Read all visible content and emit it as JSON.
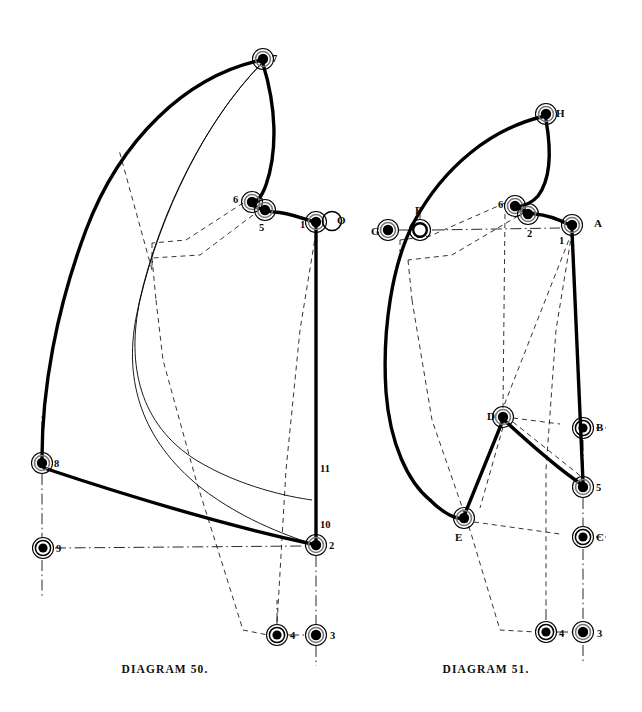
{
  "page": {
    "width": 642,
    "height": 712,
    "background": "#ffffff",
    "ink": "#000000",
    "kind": "engineering-linkage-plate"
  },
  "captions": {
    "left": "DIAGRAM 50.",
    "right": "DIAGRAM 51."
  },
  "diagram_left": {
    "name": "DIAGRAM 50.",
    "labels": [
      {
        "id": "7",
        "text": "7",
        "x": 272,
        "y": 53
      },
      {
        "id": "6",
        "text": "6",
        "x": 233,
        "y": 194
      },
      {
        "id": "5",
        "text": "5",
        "x": 259,
        "y": 222
      },
      {
        "id": "1",
        "text": "1",
        "x": 300,
        "y": 219
      },
      {
        "id": "O",
        "text": "O",
        "x": 337,
        "y": 215
      },
      {
        "id": "8",
        "text": "8",
        "x": 54,
        "y": 458
      },
      {
        "id": "9",
        "text": "9",
        "x": 56,
        "y": 543
      },
      {
        "id": "11",
        "text": "11",
        "x": 320,
        "y": 463
      },
      {
        "id": "10",
        "text": "10",
        "x": 320,
        "y": 519
      },
      {
        "id": "2",
        "text": "2",
        "x": 329,
        "y": 540
      },
      {
        "id": "4",
        "text": "4",
        "x": 290,
        "y": 630
      },
      {
        "id": "3",
        "text": "3",
        "x": 330,
        "y": 630
      }
    ],
    "joints": [
      {
        "id": "7",
        "x": 263,
        "y": 59,
        "style": "solid-dot-ring"
      },
      {
        "id": "6",
        "x": 252,
        "y": 202,
        "style": "solid-dot-ring"
      },
      {
        "id": "5",
        "x": 265,
        "y": 210,
        "style": "solid-dot-ring"
      },
      {
        "id": "1",
        "x": 316,
        "y": 222,
        "style": "solid-dot-ring"
      },
      {
        "id": "O",
        "x": 332,
        "y": 221,
        "style": "open-ring"
      },
      {
        "id": "8",
        "x": 42,
        "y": 463,
        "style": "solid-dot-ring"
      },
      {
        "id": "9",
        "x": 43,
        "y": 548,
        "style": "hollow-dot-ring"
      },
      {
        "id": "2",
        "x": 316,
        "y": 545,
        "style": "solid-dot-ring"
      },
      {
        "id": "4",
        "x": 277,
        "y": 635,
        "style": "hollow-dot-ring"
      },
      {
        "id": "3",
        "x": 316,
        "y": 635,
        "style": "solid-dot-ring"
      }
    ]
  },
  "diagram_right": {
    "name": "DIAGRAM 51.",
    "labels": [
      {
        "id": "H",
        "text": "H",
        "x": 556,
        "y": 108
      },
      {
        "id": "G",
        "text": "G",
        "x": 371,
        "y": 226
      },
      {
        "id": "F",
        "text": "F",
        "x": 415,
        "y": 205
      },
      {
        "id": "6",
        "text": "6",
        "x": 498,
        "y": 199
      },
      {
        "id": "2",
        "text": "2",
        "x": 527,
        "y": 228
      },
      {
        "id": "1",
        "text": "1",
        "x": 559,
        "y": 235
      },
      {
        "id": "A",
        "text": "A",
        "x": 594,
        "y": 218
      },
      {
        "id": "D",
        "text": "D",
        "x": 487,
        "y": 411
      },
      {
        "id": "B",
        "text": "B",
        "x": 596,
        "y": 422
      },
      {
        "id": "5",
        "text": "5",
        "x": 596,
        "y": 482
      },
      {
        "id": "E",
        "text": "E",
        "x": 455,
        "y": 532
      },
      {
        "id": "C",
        "text": "C",
        "x": 596,
        "y": 532
      },
      {
        "id": "4",
        "text": "4",
        "x": 559,
        "y": 628
      },
      {
        "id": "3",
        "text": "3",
        "x": 597,
        "y": 628
      }
    ],
    "joints": [
      {
        "id": "H",
        "x": 546,
        "y": 114,
        "style": "solid-dot-ring"
      },
      {
        "id": "G",
        "x": 388,
        "y": 230,
        "style": "solid-dot-ring"
      },
      {
        "id": "F",
        "x": 420,
        "y": 230,
        "style": "open-ring"
      },
      {
        "id": "6",
        "x": 515,
        "y": 206,
        "style": "solid-dot-ring"
      },
      {
        "id": "2",
        "x": 528,
        "y": 214,
        "style": "solid-dot-ring"
      },
      {
        "id": "A",
        "x": 572,
        "y": 225,
        "style": "solid-dot-ring"
      },
      {
        "id": "D",
        "x": 503,
        "y": 417,
        "style": "solid-dot-ring"
      },
      {
        "id": "B",
        "x": 583,
        "y": 428,
        "style": "hollow-dot-ring"
      },
      {
        "id": "5",
        "x": 583,
        "y": 487,
        "style": "solid-dot-ring"
      },
      {
        "id": "E",
        "x": 464,
        "y": 518,
        "style": "solid-dot-ring"
      },
      {
        "id": "C",
        "x": 583,
        "y": 537,
        "style": "hollow-dot-ring"
      },
      {
        "id": "4",
        "x": 546,
        "y": 632,
        "style": "hollow-dot-ring"
      },
      {
        "id": "3",
        "x": 583,
        "y": 632,
        "style": "solid-dot-ring"
      }
    ]
  }
}
